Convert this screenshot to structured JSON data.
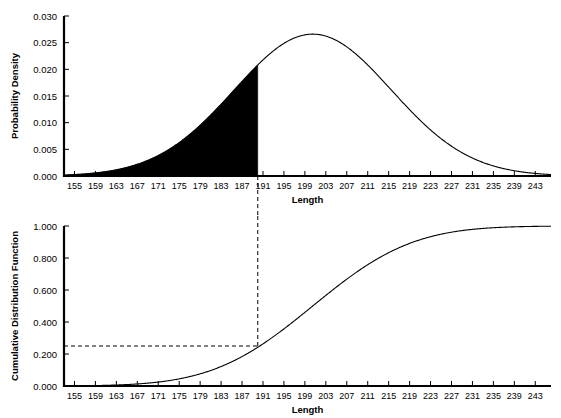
{
  "figure": {
    "background_color": "#ffffff",
    "line_color": "#000000",
    "fill_color": "#000000"
  },
  "chart_data": [
    {
      "type": "area",
      "title": "",
      "subtitle": "",
      "xlabel": "Length",
      "ylabel": "Probability Density",
      "xlim": [
        153,
        246
      ],
      "ylim": [
        0.0,
        0.03
      ],
      "grid": false,
      "legend": "none",
      "x_ticks": [
        155,
        159,
        163,
        167,
        171,
        175,
        179,
        183,
        187,
        191,
        195,
        199,
        203,
        207,
        211,
        215,
        219,
        223,
        227,
        231,
        235,
        239,
        243
      ],
      "y_ticks": [
        0.0,
        0.005,
        0.01,
        0.015,
        0.02,
        0.025,
        0.03
      ],
      "y_tick_labels": [
        "0.000",
        "0.005",
        "0.010",
        "0.015",
        "0.020",
        "0.025",
        "0.030"
      ],
      "distribution": {
        "name": "normal",
        "mean": 200.5,
        "std_dev": 15.0,
        "peak_density": 0.0266
      },
      "shaded_region": {
        "from": 153,
        "to": 190,
        "color": "#000000",
        "description": "left tail filled to x = 190"
      },
      "x": [
        155,
        159,
        163,
        167,
        171,
        175,
        179,
        183,
        187,
        190,
        191,
        195,
        199,
        200.5,
        203,
        207,
        211,
        215,
        219,
        223,
        227,
        231,
        235,
        239,
        243
      ],
      "values": [
        0.00061,
        0.00123,
        0.00228,
        0.00391,
        0.00622,
        0.00918,
        0.01252,
        0.01581,
        0.01851,
        0.02005,
        0.02049,
        0.02166,
        0.02213,
        0.02216,
        0.02193,
        0.02054,
        0.01801,
        0.01466,
        0.01103,
        0.00769,
        0.00496,
        0.00296,
        0.00163,
        0.00083,
        0.00039
      ]
    },
    {
      "type": "line",
      "title": "",
      "subtitle": "",
      "xlabel": "Length",
      "ylabel": "Cumulative Distribution Function",
      "xlim": [
        153,
        246
      ],
      "ylim": [
        0.0,
        1.0
      ],
      "grid": false,
      "legend": "none",
      "x_ticks": [
        155,
        159,
        163,
        167,
        171,
        175,
        179,
        183,
        187,
        191,
        195,
        199,
        203,
        207,
        211,
        215,
        219,
        223,
        227,
        231,
        235,
        239,
        243
      ],
      "y_ticks": [
        0.0,
        0.2,
        0.4,
        0.6,
        0.8,
        1.0
      ],
      "y_tick_labels": [
        "0.000",
        "0.200",
        "0.400",
        "0.600",
        "0.800",
        "1.000"
      ],
      "distribution": {
        "name": "normal",
        "mean": 200.5,
        "std_dev": 15.0
      },
      "annotations": [
        {
          "type": "dashed-guide-vertical",
          "x": 190,
          "label": "190"
        },
        {
          "type": "dashed-guide-horizontal",
          "y": 0.25,
          "label": "0.25"
        }
      ],
      "x": [
        155,
        159,
        163,
        167,
        171,
        175,
        179,
        183,
        187,
        190,
        191,
        195,
        199,
        203,
        207,
        211,
        215,
        219,
        223,
        227,
        231,
        235,
        239,
        243
      ],
      "values": [
        0.00121,
        0.00484,
        0.01174,
        0.02402,
        0.04405,
        0.07493,
        0.11816,
        0.17619,
        0.2451,
        0.30854,
        0.32726,
        0.41294,
        0.5,
        0.58706,
        0.66974,
        0.74215,
        0.80643,
        0.86093,
        0.90512,
        0.93996,
        0.96164,
        0.97826,
        0.98843,
        0.99396
      ]
    }
  ],
  "labels": {
    "pdf_y_axis": "Probability Density",
    "cdf_y_axis": "Cumulative Distribution Function",
    "x_axis": "Length"
  }
}
